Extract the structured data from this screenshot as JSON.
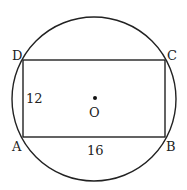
{
  "diagram": {
    "circle": {
      "center_label": "O",
      "cx": 94,
      "cy": 98,
      "r": 82
    },
    "rectangle": {
      "vertices": {
        "A": {
          "label": "A",
          "x": 23,
          "y": 137
        },
        "B": {
          "label": "B",
          "x": 165,
          "y": 137
        },
        "C": {
          "label": "C",
          "x": 165,
          "y": 60
        },
        "D": {
          "label": "D",
          "x": 23,
          "y": 60
        }
      },
      "side_AD": "12",
      "side_AB": "16"
    },
    "stroke_color": "#222222"
  }
}
